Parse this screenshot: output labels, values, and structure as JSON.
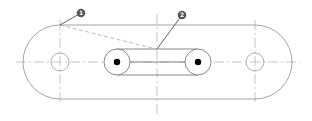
{
  "diagram": {
    "type": "technical-drawing",
    "colors": {
      "outline": "#9a9a9a",
      "centerline": "#b8b8b8",
      "dashed": "#a8a8a8",
      "callout_fill": "#555555",
      "callout_text": "#ffffff",
      "pin_fill": "#000000"
    },
    "callouts": [
      {
        "id": "1",
        "label": "1"
      },
      {
        "id": "2",
        "label": "2"
      }
    ]
  }
}
